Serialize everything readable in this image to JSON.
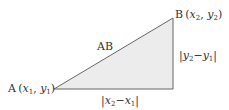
{
  "diagram": {
    "type": "right-triangle-distance",
    "fill_color": "#ececec",
    "stroke_color": "#666666",
    "vertices": {
      "A": {
        "label": "A",
        "coord_x": "x",
        "coord_x_sub": "1",
        "coord_y": "y",
        "coord_y_sub": "1"
      },
      "B": {
        "label": "B",
        "coord_x": "x",
        "coord_x_sub": "2",
        "coord_y": "y",
        "coord_y_sub": "2"
      }
    },
    "hypotenuse_label": "AB",
    "horizontal_leg": {
      "a": "x",
      "a_sub": "2",
      "minus": "−",
      "b": "x",
      "b_sub": "1"
    },
    "vertical_leg": {
      "a": "y",
      "a_sub": "2",
      "minus": "−",
      "b": "y",
      "b_sub": "1"
    }
  }
}
